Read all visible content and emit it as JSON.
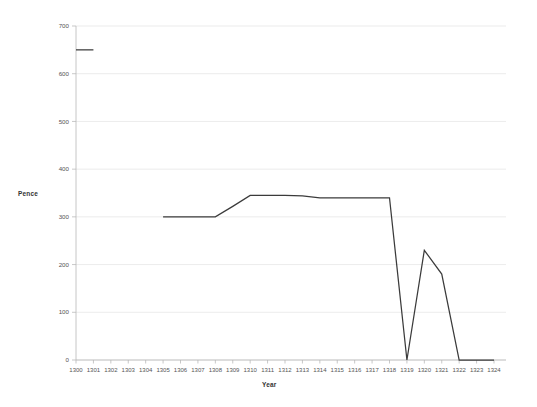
{
  "chart_data": {
    "type": "line",
    "title": "",
    "xlabel": "Year",
    "ylabel": "Pence",
    "xlim": [
      1300,
      1324
    ],
    "ylim": [
      0,
      700
    ],
    "ytick_step": 100,
    "grid": true,
    "legend": "none",
    "line_color": "#3b3b3b",
    "grid_color": "#e3e3e3",
    "axis_color": "#b8b8b8",
    "background_color": "#ffffff",
    "x_ticks": [
      "1300",
      "1301",
      "1302",
      "1303",
      "1304",
      "1305",
      "1306",
      "1307",
      "1308",
      "1309",
      "1310",
      "1311",
      "1312",
      "1313",
      "1314",
      "1315",
      "1316",
      "1317",
      "1318",
      "1319",
      "1320",
      "1321",
      "1322",
      "1323",
      "1324"
    ],
    "y_ticks": [
      "0",
      "100",
      "200",
      "300",
      "400",
      "500",
      "600",
      "700"
    ],
    "series": [
      {
        "name": "Pence",
        "segments": [
          {
            "x": [
              1300,
              1301
            ],
            "y": [
              650,
              650
            ]
          },
          {
            "x": [
              1305,
              1306,
              1307,
              1308,
              1309,
              1310,
              1311,
              1312,
              1313,
              1314,
              1315,
              1316,
              1317,
              1318,
              1319,
              1320,
              1321,
              1322,
              1323,
              1324
            ],
            "y": [
              300,
              300,
              300,
              300,
              322,
              345,
              345,
              345,
              344,
              340,
              340,
              340,
              340,
              340,
              0,
              230,
              180,
              0,
              0,
              0
            ]
          }
        ]
      }
    ]
  },
  "axes": {
    "y_axis_label": "Pence",
    "x_axis_label": "Year"
  }
}
